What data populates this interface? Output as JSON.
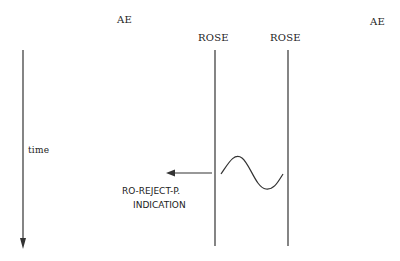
{
  "diagram": {
    "entities": {
      "left_ae": "AE",
      "left_rose": "ROSE",
      "right_rose": "ROSE",
      "right_ae": "AE"
    },
    "axis": {
      "label": "time"
    },
    "event": {
      "primitive_line1": "RO-REJECT-P.",
      "primitive_line2": "INDICATION"
    },
    "colors": {
      "line": "#333333",
      "text": "#222222",
      "background": "#ffffff"
    }
  }
}
